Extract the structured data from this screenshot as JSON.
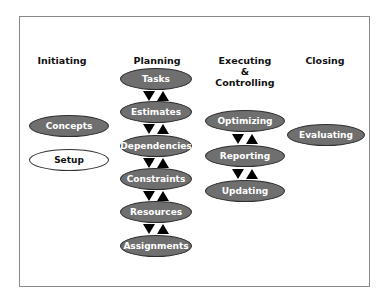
{
  "diagram": {
    "colors": {
      "node_fill": "#6f6f6f",
      "node_border": "#2e2e2e",
      "node_text": "#ffffff",
      "light_node_fill": "#ffffff",
      "arrow": "#000000",
      "frame": "#8a8a8a"
    },
    "columns": [
      {
        "id": "initiating",
        "header": "Initiating",
        "header_lines": [
          "Initiating"
        ],
        "nodes": [
          {
            "label": "Concepts",
            "style": "filled"
          },
          {
            "label": "Setup",
            "style": "outline"
          }
        ]
      },
      {
        "id": "planning",
        "header": "Planning",
        "header_lines": [
          "Planning"
        ],
        "nodes": [
          {
            "label": "Tasks",
            "style": "filled"
          },
          {
            "label": "Estimates",
            "style": "filled"
          },
          {
            "label": "Dependencies",
            "style": "filled"
          },
          {
            "label": "Constraints",
            "style": "filled"
          },
          {
            "label": "Resources",
            "style": "filled"
          },
          {
            "label": "Assignments",
            "style": "filled"
          }
        ],
        "connectors": "bidirectional-arrows"
      },
      {
        "id": "executing",
        "header": "Executing & Controlling",
        "header_lines": [
          "Executing",
          "&",
          "Controlling"
        ],
        "nodes": [
          {
            "label": "Optimizing",
            "style": "filled"
          },
          {
            "label": "Reporting",
            "style": "filled"
          },
          {
            "label": "Updating",
            "style": "filled"
          }
        ],
        "connectors": "bidirectional-arrows"
      },
      {
        "id": "closing",
        "header": "Closing",
        "header_lines": [
          "Closing"
        ],
        "nodes": [
          {
            "label": "Evaluating",
            "style": "filled"
          }
        ]
      }
    ]
  }
}
